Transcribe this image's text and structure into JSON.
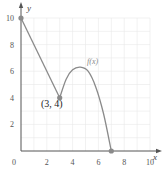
{
  "chart_data": {
    "type": "line",
    "title": "",
    "xlabel": "x",
    "ylabel": "y",
    "xlim": [
      0,
      10
    ],
    "ylim": [
      0,
      10
    ],
    "grid": true,
    "x_ticks": [
      "0",
      "2",
      "4",
      "6",
      "8",
      "10"
    ],
    "y_ticks": [
      "2",
      "4",
      "6",
      "8",
      "10"
    ],
    "series": [
      {
        "name": "f(x)",
        "segments": [
          {
            "kind": "line",
            "points": [
              [
                0,
                10
              ],
              [
                3,
                4
              ]
            ]
          },
          {
            "kind": "curve",
            "points": [
              [
                3,
                4
              ],
              [
                3.5,
                5.4
              ],
              [
                4,
                6.1
              ],
              [
                4.6,
                6.3
              ],
              [
                5.2,
                6.0
              ],
              [
                5.8,
                4.8
              ],
              [
                6.4,
                2.8
              ],
              [
                7,
                0
              ]
            ]
          }
        ]
      }
    ],
    "marked_points": [
      [
        0,
        10
      ],
      [
        3,
        4
      ],
      [
        7,
        0
      ]
    ],
    "annotations": [
      {
        "text": "(3, 4)",
        "x": 3,
        "y": 4
      },
      {
        "text": "f(x)",
        "x": 5.5,
        "y": 7.2
      }
    ],
    "colors": {
      "curve": "#8a8a8a",
      "axis": "#555555",
      "grid": "#e8e8e8",
      "point": "#8a8a8a"
    }
  },
  "labels": {
    "x_axis": "x",
    "y_axis": "y",
    "origin": "0",
    "point_label": "(3, 4)",
    "function_label": "f(x)"
  }
}
